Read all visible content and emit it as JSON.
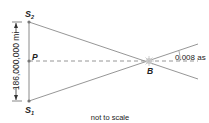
{
  "diagram": {
    "type": "parallax-geometry",
    "points": {
      "S2": {
        "label": "S",
        "sub": "2"
      },
      "S1": {
        "label": "S",
        "sub": "1"
      },
      "P": {
        "label": "P"
      },
      "B": {
        "label": "B"
      }
    },
    "dimension_label": "186,000,000 mi",
    "angle_label": "0.008 as",
    "caption": "not to scale",
    "colors": {
      "line": "#8a8a8a",
      "dashed": "#8a8a8a",
      "text": "#222222",
      "star": "#c8c8c8"
    }
  }
}
